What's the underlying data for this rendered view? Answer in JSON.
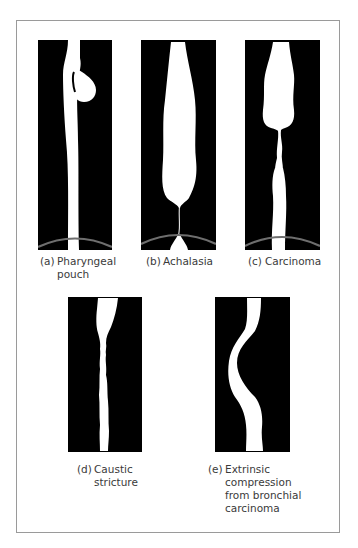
{
  "figure": {
    "panels": [
      {
        "id": "a",
        "tag": "(a)",
        "lines": [
          "Pharyngeal",
          "pouch"
        ]
      },
      {
        "id": "b",
        "tag": "(b)",
        "lines": [
          "Achalasia"
        ]
      },
      {
        "id": "c",
        "tag": "(c)",
        "lines": [
          "Carcinoma"
        ]
      },
      {
        "id": "d",
        "tag": "(d)",
        "lines": [
          "Caustic",
          "stricture"
        ]
      },
      {
        "id": "e",
        "tag": "(e)",
        "lines": [
          "Extrinsic",
          "compression",
          "from bronchial",
          "carcinoma"
        ]
      }
    ],
    "colors": {
      "background": "#ffffff",
      "panel": "#000000",
      "barium": "#ffffff",
      "diaphragm": "#6e6e6e",
      "frame": "#9a9a9a",
      "label": "#3a3a3a"
    }
  }
}
